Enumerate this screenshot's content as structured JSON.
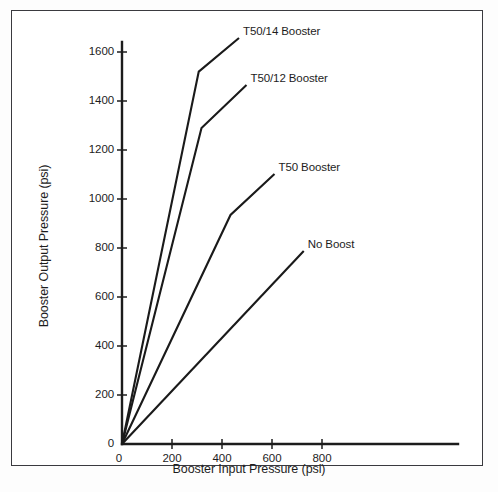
{
  "chart_data": {
    "type": "line",
    "title": "",
    "xlabel": "Booster Input Pressure (psi)",
    "ylabel": "Booster Output Pressure (psi)",
    "xlim": [
      0,
      1000
    ],
    "ylim": [
      0,
      1700
    ],
    "xticks": [
      0,
      200,
      400,
      600,
      800
    ],
    "yticks": [
      0,
      200,
      400,
      600,
      800,
      1000,
      1200,
      1400,
      1600
    ],
    "xtick_labels": [
      "0",
      "200",
      "400",
      "600",
      "800"
    ],
    "ytick_labels": [
      "0",
      "200",
      "400",
      "600",
      "800",
      "1000",
      "1200",
      "1400",
      "1600"
    ],
    "grid": false,
    "legend": "inline-annotations",
    "line_color": "#1a1a1a",
    "series": [
      {
        "name": "T50/14 Booster",
        "label": "T50/14 Booster",
        "x": [
          0,
          307,
          468
        ],
        "y": [
          0,
          1520,
          1657
        ],
        "label_x": 468,
        "label_y": 1657
      },
      {
        "name": "T50/12 Booster",
        "label": "T50/12 Booster",
        "x": [
          0,
          318,
          498
        ],
        "y": [
          0,
          1290,
          1465
        ],
        "label_x": 498,
        "label_y": 1465
      },
      {
        "name": "T50 Booster",
        "label": "T50 Booster",
        "x": [
          0,
          434,
          610
        ],
        "y": [
          0,
          935,
          1102
        ],
        "label_x": 610,
        "label_y": 1102
      },
      {
        "name": "No Boost",
        "label": "No Boost",
        "x": [
          0,
          727
        ],
        "y": [
          0,
          788
        ],
        "label_x": 727,
        "label_y": 788
      }
    ]
  },
  "axes": {
    "x_axis_name": "x-axis",
    "y_axis_name": "y-axis"
  }
}
